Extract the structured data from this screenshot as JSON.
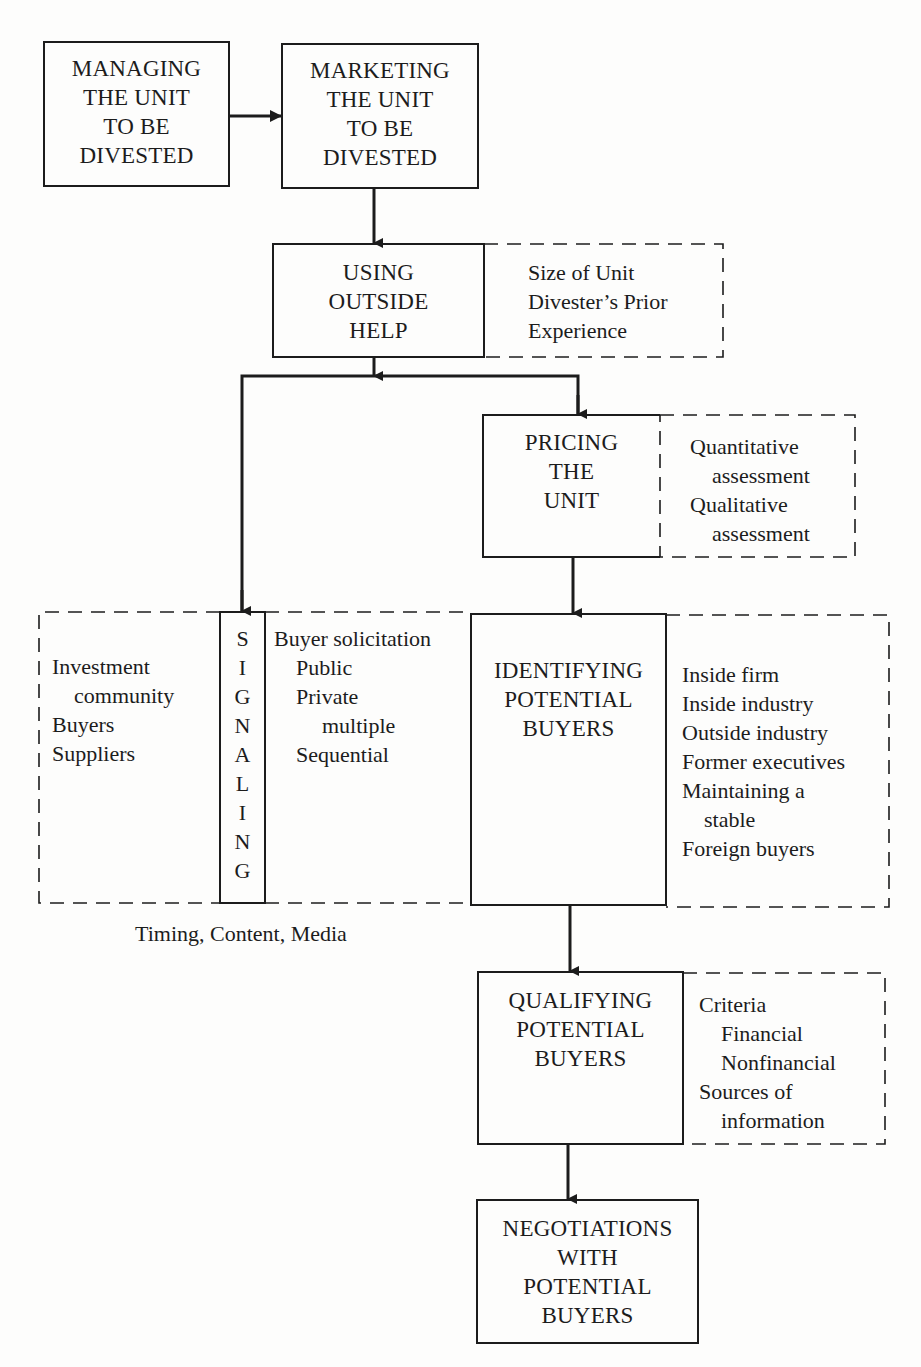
{
  "diagram": {
    "colors": {
      "line": "#1c1c1c",
      "background": "#fdfdfc"
    },
    "nodes": {
      "managing": {
        "lines": [
          "MANAGING",
          "THE UNIT",
          "TO BE",
          "DIVESTED"
        ]
      },
      "marketing": {
        "lines": [
          "MARKETING",
          "THE UNIT",
          "TO BE",
          "DIVESTED"
        ]
      },
      "outside_help": {
        "lines": [
          "USING",
          "OUTSIDE",
          "HELP"
        ],
        "factors": [
          "Size of Unit",
          "Divester’s Prior",
          "Experience"
        ]
      },
      "pricing": {
        "lines": [
          "PRICING",
          "THE",
          "UNIT"
        ],
        "factors": [
          "Quantitative",
          "assessment",
          "Qualitative",
          "assessment"
        ]
      },
      "signaling": {
        "letters": [
          "S",
          "I",
          "G",
          "N",
          "A",
          "L",
          "I",
          "N",
          "G"
        ],
        "audiences": [
          "Investment",
          "community",
          "Buyers",
          "Suppliers"
        ],
        "methods": [
          "Buyer solicitation",
          "Public",
          "Private",
          "multiple",
          "Sequential"
        ],
        "caption": "Timing, Content, Media"
      },
      "identifying": {
        "lines": [
          "IDENTIFYING",
          "POTENTIAL",
          "BUYERS"
        ],
        "factors": [
          "Inside firm",
          "Inside industry",
          "Outside industry",
          "Former executives",
          "Maintaining a",
          "stable",
          "Foreign buyers"
        ]
      },
      "qualifying": {
        "lines": [
          "QUALIFYING",
          "POTENTIAL",
          "BUYERS"
        ],
        "factors": [
          "Criteria",
          "Financial",
          "Nonfinancial",
          "Sources of",
          "information"
        ]
      },
      "negotiations": {
        "lines": [
          "NEGOTIATIONS",
          "WITH",
          "POTENTIAL",
          "BUYERS"
        ]
      }
    },
    "edges": [
      {
        "from": "managing",
        "to": "marketing"
      },
      {
        "from": "marketing",
        "to": "outside_help"
      },
      {
        "from": "outside_help",
        "to": "signaling"
      },
      {
        "from": "outside_help",
        "to": "pricing"
      },
      {
        "from": "pricing",
        "to": "identifying"
      },
      {
        "from": "identifying",
        "to": "qualifying"
      },
      {
        "from": "qualifying",
        "to": "negotiations"
      }
    ]
  }
}
